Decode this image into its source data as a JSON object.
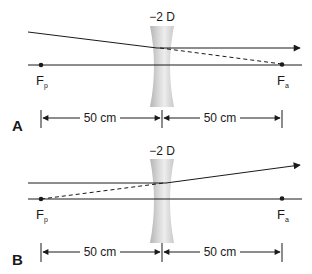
{
  "figure": {
    "panels": [
      {
        "id": "A",
        "label": "A",
        "lens_power": "−2 D",
        "focal_points": [
          {
            "symbol": "F",
            "subscript": "p",
            "name": "primary focal point"
          },
          {
            "symbol": "F",
            "subscript": "a",
            "name": "secondary focal point"
          }
        ],
        "dimensions": [
          {
            "label": "50 cm"
          },
          {
            "label": "50 cm"
          }
        ],
        "ray_description": "Converging ray directed toward Fa exits the diverging lens parallel to the optical axis"
      },
      {
        "id": "B",
        "label": "B",
        "lens_power": "−2 D",
        "focal_points": [
          {
            "symbol": "F",
            "subscript": "p",
            "name": "primary focal point"
          },
          {
            "symbol": "F",
            "subscript": "a",
            "name": "secondary focal point"
          }
        ],
        "dimensions": [
          {
            "label": "50 cm"
          },
          {
            "label": "50 cm"
          }
        ],
        "ray_description": "Parallel ray diverges after the lens as if originating from Fp"
      }
    ],
    "colors": {
      "line": "#1a1a1a",
      "lens_light": "#e6e6e6",
      "lens_dark": "#a8a8a8",
      "background": "#ffffff"
    }
  }
}
